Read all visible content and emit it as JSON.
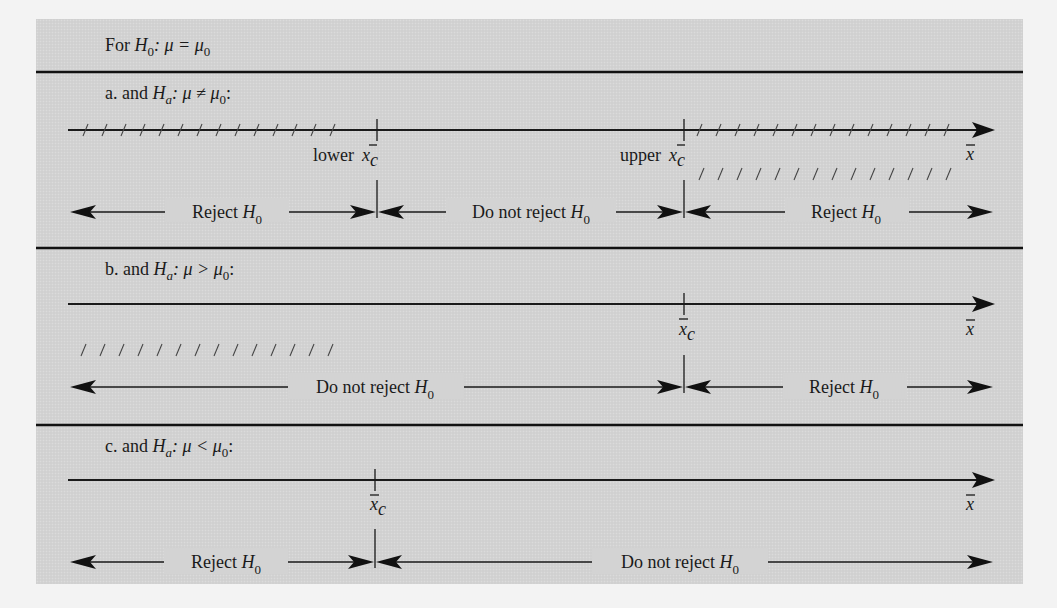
{
  "header": {
    "prefix": "For ",
    "H": "H",
    "H_sub": "0",
    "rest": ": μ = μ",
    "rest_sub": "0"
  },
  "sections": [
    {
      "id": "a",
      "label_prefix": "a.  and ",
      "H": "H",
      "H_sub": "a",
      "relation": ": μ ≠ μ",
      "rel_sub": "0",
      "trail": ":",
      "axis_var": "x",
      "crit_lower_label": "lower",
      "crit_upper_label": "upper",
      "crit_var": "x",
      "crit_sub": "c",
      "regions": [
        {
          "text": "Reject ",
          "H": "H",
          "H_sub": "0"
        },
        {
          "text": "Do not reject ",
          "H": "H",
          "H_sub": "0"
        },
        {
          "text": "Reject ",
          "H": "H",
          "H_sub": "0"
        }
      ]
    },
    {
      "id": "b",
      "label_prefix": "b.  and ",
      "H": "H",
      "H_sub": "a",
      "relation": ": μ > μ",
      "rel_sub": "0",
      "trail": ":",
      "axis_var": "x",
      "crit_var": "x",
      "crit_sub": "c",
      "regions": [
        {
          "text": "Do not reject ",
          "H": "H",
          "H_sub": "0"
        },
        {
          "text": "Reject ",
          "H": "H",
          "H_sub": "0"
        }
      ]
    },
    {
      "id": "c",
      "label_prefix": "c.  and ",
      "H": "H",
      "H_sub": "a",
      "relation": ": μ < μ",
      "rel_sub": "0",
      "trail": ":",
      "axis_var": "x",
      "crit_var": "x",
      "crit_sub": "c",
      "regions": [
        {
          "text": "Reject ",
          "H": "H",
          "H_sub": "0"
        },
        {
          "text": "Do not reject ",
          "H": "H",
          "H_sub": "0"
        }
      ]
    }
  ],
  "colors": {
    "panel": "#d3d3d3",
    "page": "#f3f3f3",
    "ink": "#1a1a1a"
  }
}
